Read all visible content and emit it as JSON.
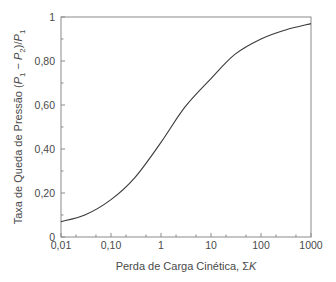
{
  "chart_data": {
    "type": "line",
    "title": "",
    "xlabel": "Perda de Carga Cinética, ΣK",
    "ylabel": "Taxa de Queda de Pressão (P1 − P2)/P1",
    "xscale": "log",
    "xlim": [
      0.01,
      1000
    ],
    "ylim": [
      0,
      1
    ],
    "grid": false,
    "legend": null,
    "x_ticks": [
      "0,01",
      "0,10",
      "1",
      "10",
      "100",
      "1000"
    ],
    "y_ticks": [
      "0",
      "0,20",
      "0,40",
      "0,60",
      "0,80",
      "1"
    ],
    "series": [
      {
        "name": "curve",
        "x": [
          0.01,
          0.03,
          0.1,
          0.3,
          1,
          3,
          10,
          30,
          100,
          300,
          1000
        ],
        "values": [
          0.07,
          0.1,
          0.17,
          0.27,
          0.43,
          0.59,
          0.72,
          0.83,
          0.9,
          0.94,
          0.97
        ]
      }
    ]
  },
  "axes": {
    "x_label_main": "Perda de Carga Cinética, Σ",
    "x_label_var": "K",
    "y_label_main": "Taxa de Queda de Pressão (",
    "y_label_p1": "P",
    "y_label_sub1": "1",
    "y_label_minus": " − ",
    "y_label_p2": "P",
    "y_label_sub2": "2",
    "y_label_div": ")/",
    "y_label_p3": "P",
    "y_label_sub3": "1"
  },
  "colors": {
    "axis": "#8a8a8a",
    "curve": "#3a3a3a",
    "text": "#4a4a4a"
  }
}
